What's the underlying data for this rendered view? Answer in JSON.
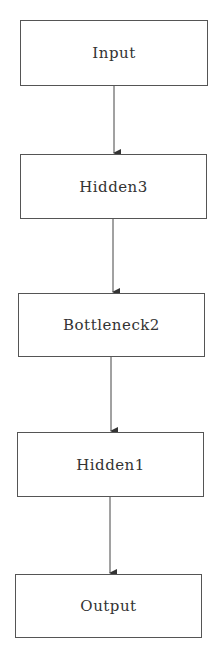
{
  "diagram": {
    "type": "flowchart",
    "direction": "top-to-bottom",
    "colors": {
      "border": "#555555",
      "text": "#333333",
      "arrow": "#333333",
      "background": "#ffffff"
    },
    "nodes": [
      {
        "id": "input",
        "label": "Input"
      },
      {
        "id": "hidden3",
        "label": "Hidden3"
      },
      {
        "id": "bottleneck2",
        "label": "Bottleneck2"
      },
      {
        "id": "hidden1",
        "label": "Hidden1"
      },
      {
        "id": "output",
        "label": "Output"
      }
    ],
    "edges": [
      {
        "from": "input",
        "to": "hidden3"
      },
      {
        "from": "hidden3",
        "to": "bottleneck2"
      },
      {
        "from": "bottleneck2",
        "to": "hidden1"
      },
      {
        "from": "hidden1",
        "to": "output"
      }
    ]
  }
}
